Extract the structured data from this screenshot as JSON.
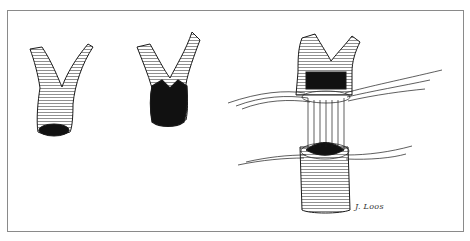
{
  "figure": {
    "panels": [
      {
        "id": "panel-1",
        "label": "bifurcated vessel with small oval lumen"
      },
      {
        "id": "panel-2",
        "label": "bifurcated vessel with enlarged spatulated lumen"
      },
      {
        "id": "panel-3",
        "label": "anastomosis of bifurcated vessel to recipient vessel with parachute sutures"
      }
    ],
    "signature": "J. Loos",
    "colors": {
      "ink": "#1a1a1a",
      "border": "#8a8a8a",
      "background": "#ffffff"
    }
  }
}
